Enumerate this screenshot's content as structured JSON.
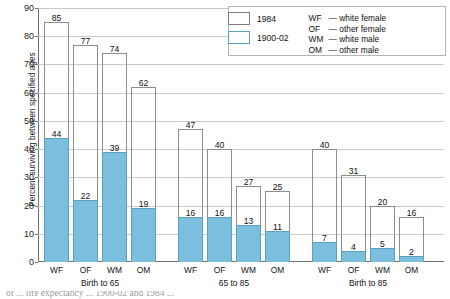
{
  "chart_data": {
    "type": "bar",
    "title": "",
    "xlabel": "",
    "ylabel": "Percent surviving between specified ages",
    "ylim": [
      0,
      90
    ],
    "ytick_step": 10,
    "yticks": [
      0,
      10,
      20,
      30,
      40,
      50,
      60,
      70,
      80,
      90
    ],
    "grid": true,
    "legend_position": "top-right",
    "categories": [
      "WF",
      "OF",
      "WM",
      "OM",
      "WF",
      "OF",
      "WM",
      "OM",
      "WF",
      "OF",
      "WM",
      "OM"
    ],
    "groups": [
      {
        "label": "Birth to 65",
        "categories": [
          "WF",
          "OF",
          "WM",
          "OM"
        ],
        "values_1984": [
          85,
          77,
          74,
          62
        ],
        "values_1900_02": [
          44,
          22,
          39,
          19
        ]
      },
      {
        "label": "65 to 85",
        "categories": [
          "WF",
          "OF",
          "WM",
          "OM"
        ],
        "values_1984": [
          47,
          40,
          27,
          25
        ],
        "values_1900_02": [
          16,
          16,
          13,
          11
        ]
      },
      {
        "label": "Birth to 85",
        "categories": [
          "WF",
          "OF",
          "WM",
          "OM"
        ],
        "values_1984": [
          40,
          31,
          20,
          16
        ],
        "values_1900_02": [
          7,
          4,
          5,
          2
        ]
      }
    ],
    "series": [
      {
        "name": "1984",
        "values": [
          85,
          77,
          74,
          62,
          47,
          40,
          27,
          25,
          40,
          31,
          20,
          16
        ],
        "color": "#ffffff"
      },
      {
        "name": "1900-02",
        "values": [
          44,
          22,
          39,
          19,
          16,
          16,
          13,
          11,
          7,
          4,
          5,
          2
        ],
        "color": "#7cbedd"
      }
    ]
  },
  "legend": {
    "entries": [
      {
        "label": "1984",
        "swatch": "white"
      },
      {
        "label": "1900-02",
        "swatch": "blue"
      }
    ],
    "abbreviations": [
      {
        "code": "WF",
        "dash": "—",
        "text": "white female"
      },
      {
        "code": "OF",
        "dash": "—",
        "text": "other female"
      },
      {
        "code": "WM",
        "dash": "—",
        "text": "white male"
      },
      {
        "code": "OM",
        "dash": "—",
        "text": "other male"
      }
    ]
  },
  "colors": {
    "bar_1900_fill": "#7cbedd",
    "bar_1900_stroke": "#5d9fc0",
    "bar_1984_stroke": "#8d8d8d",
    "gridline": "#c9c9c9",
    "axis": "#6f6f6f"
  },
  "caption": {
    "text": "of ... life expectancy ... 1900-02 and 1984 ..."
  }
}
